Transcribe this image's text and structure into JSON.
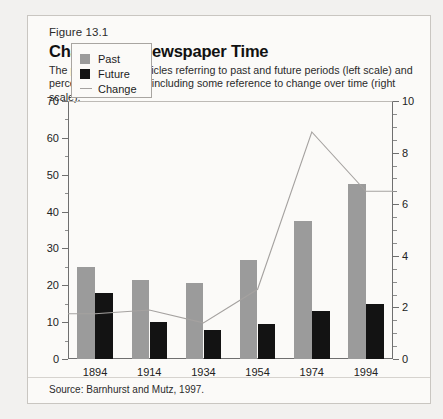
{
  "figure": {
    "number": "Figure 13.1",
    "title": "Changes in Newspaper Time",
    "subtitle": "The percentage of articles referring to past and future periods (left scale) and percentage of stories including some reference to change over time (right scale).",
    "source": "Source: Barnhurst and Mutz, 1997."
  },
  "colors": {
    "past": "#9b9b9b",
    "future": "#131313",
    "change": "#a5a2a0",
    "axis": "#6f6f6f",
    "card_bg": "#fbfaf8",
    "page_bg": "#f2f1ef"
  },
  "legend": {
    "items": [
      {
        "label": "Past",
        "marker": "square-gray"
      },
      {
        "label": "Future",
        "marker": "square-black"
      },
      {
        "label": "Change",
        "marker": "line-gray"
      }
    ]
  },
  "chart_data": {
    "type": "bar",
    "title": "Changes in Newspaper Time",
    "subtitle": "The percentage of articles referring to past and future periods (left scale) and percentage of stories including some reference to change over time (right scale).",
    "xlabel": "",
    "ylabel": "",
    "categories": [
      "1894",
      "1914",
      "1934",
      "1954",
      "1974",
      "1994"
    ],
    "series": [
      {
        "name": "Past",
        "type": "bar",
        "axis": "left",
        "values": [
          25,
          21.5,
          20.5,
          27,
          37.5,
          47.5
        ]
      },
      {
        "name": "Future",
        "type": "bar",
        "axis": "left",
        "values": [
          18,
          10,
          8,
          9.5,
          13,
          15
        ]
      },
      {
        "name": "Change",
        "type": "line",
        "axis": "right",
        "values": [
          1.75,
          1.9,
          1.4,
          2.7,
          8.8,
          6.5
        ]
      }
    ],
    "ylim": [
      0,
      70
    ],
    "yticks": [
      0,
      10,
      20,
      30,
      40,
      50,
      60,
      70
    ],
    "yminor_step": 5,
    "y2lim": [
      0,
      10
    ],
    "y2ticks": [
      0,
      2,
      4,
      6,
      8,
      10
    ],
    "y2minor_step": 0.5,
    "grid": false,
    "legend_position": "upper-left"
  }
}
